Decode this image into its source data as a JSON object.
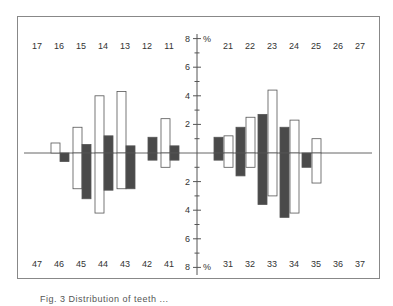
{
  "chart_data": {
    "type": "bar",
    "title": "",
    "ylabel": "%",
    "ylim": [
      -8,
      8
    ],
    "y_ticks_upper": [
      "8",
      "6",
      "4",
      "2"
    ],
    "y_ticks_lower": [
      "2",
      "4",
      "6",
      "8"
    ],
    "unit_label": "%",
    "series_names": [
      "white bars",
      "dark bars"
    ],
    "upper_left": {
      "teeth": [
        "17",
        "16",
        "15",
        "14",
        "13",
        "12",
        "11"
      ],
      "white": [
        0,
        0.7,
        1.8,
        4.0,
        4.3,
        0,
        2.4
      ],
      "dark": [
        0,
        0,
        0.6,
        1.2,
        0.5,
        1.1,
        0.5
      ]
    },
    "lower_left": {
      "teeth": [
        "47",
        "46",
        "45",
        "44",
        "43",
        "42",
        "41"
      ],
      "white": [
        0,
        0,
        2.5,
        4.2,
        2.5,
        0,
        1.0
      ],
      "dark": [
        0,
        0.6,
        3.2,
        2.6,
        2.5,
        0.5,
        0.5
      ]
    },
    "upper_right": {
      "teeth": [
        "21",
        "22",
        "23",
        "24",
        "25",
        "26",
        "27"
      ],
      "dark": [
        1.1,
        1.8,
        2.7,
        1.8,
        0,
        0,
        0
      ],
      "white": [
        1.2,
        2.5,
        4.4,
        2.3,
        1.0,
        0,
        0
      ]
    },
    "lower_right": {
      "teeth": [
        "31",
        "32",
        "33",
        "34",
        "35",
        "36",
        "37"
      ],
      "dark": [
        0.5,
        1.6,
        3.6,
        4.5,
        1.0,
        0,
        0
      ],
      "white": [
        1.0,
        1.0,
        3.0,
        4.2,
        2.1,
        0,
        0
      ]
    },
    "colors": {
      "dark": "#4a4a4a",
      "white": "#ffffff",
      "stroke": "#555555",
      "text": "#333333"
    }
  },
  "caption": "Fig. 3  Distribution of teeth ..."
}
